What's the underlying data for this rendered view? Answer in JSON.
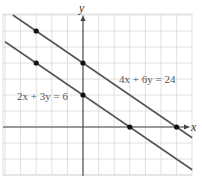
{
  "chart_data": {
    "type": "line",
    "title": "",
    "xlabel": "x",
    "ylabel": "y",
    "xlim": [
      -5,
      7.5
    ],
    "ylim": [
      -3,
      7
    ],
    "grid": true,
    "series": [
      {
        "name": "2x + 3y = 6",
        "equation": "2x + 3y = 6",
        "points": [
          [
            -3,
            4
          ],
          [
            0,
            2
          ],
          [
            3,
            0
          ]
        ],
        "line_extent": [
          [
            -5,
            5.33
          ],
          [
            7,
            -2.67
          ]
        ]
      },
      {
        "name": "4x + 6y = 24",
        "equation": "4x + 6y = 24",
        "points": [
          [
            -3,
            6
          ],
          [
            0,
            4
          ],
          [
            6,
            0
          ]
        ],
        "line_extent": [
          [
            -4.5,
            7
          ],
          [
            7,
            -0.67
          ]
        ]
      }
    ],
    "annotations": [
      {
        "text": "2x + 3y = 6",
        "position": [
          -4.5,
          2.8
        ]
      },
      {
        "text": "4x + 6y = 24",
        "position": [
          2.3,
          4.8
        ]
      }
    ],
    "colors": {
      "line": "#555555",
      "grid": "#d8d8d8",
      "axis": "#444444",
      "point": "#111111"
    }
  },
  "labels": {
    "x_axis": "x",
    "y_axis": "y",
    "eq1": "2x + 3y = 6",
    "eq2": "4x + 6y = 24"
  }
}
